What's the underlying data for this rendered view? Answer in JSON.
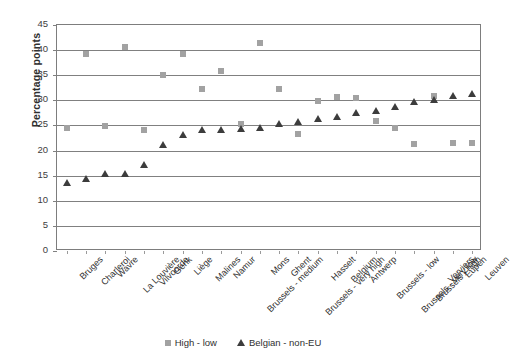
{
  "chart_data": {
    "type": "scatter",
    "title": "",
    "xlabel": "",
    "ylabel": "Percentage points",
    "ylim": [
      0,
      45
    ],
    "ytick_step": 5,
    "yticks": [
      0,
      5,
      10,
      15,
      20,
      25,
      30,
      35,
      40,
      45
    ],
    "grid": "horizontal",
    "legend_position": "bottom",
    "categories": [
      "Bruges",
      "Charleroi",
      "Wavre",
      "La Louvière",
      "Vilvoorde",
      "Genk",
      "Liège",
      "Malines",
      "Namur",
      "Brussels - medium",
      "Mons",
      "Ghent",
      "Brussels - very high",
      "Hasselt",
      "Belgium",
      "Antwerp",
      "Brussels - low",
      "Brussels - very low",
      "Brussels - high",
      "Verviers",
      "Eupen",
      "Leuven"
    ],
    "series": [
      {
        "name": "High - low",
        "marker": "square",
        "color": "#a2a2a2",
        "values": [
          24.4,
          39.2,
          24.8,
          40.6,
          24.0,
          35.1,
          39.3,
          32.2,
          35.9,
          25.2,
          41.4,
          32.2,
          23.3,
          29.8,
          30.6,
          30.4,
          25.8,
          24.4,
          21.4,
          30.8,
          21.5,
          21.5
        ]
      },
      {
        "name": "Belgian - non-EU",
        "marker": "triangle",
        "color": "#3c3c3c",
        "values": [
          13.6,
          14.4,
          15.3,
          15.4,
          17.2,
          21.2,
          23.0,
          24.0,
          24.0,
          24.3,
          24.5,
          25.2,
          25.6,
          26.2,
          26.7,
          27.4,
          27.8,
          28.6,
          29.6,
          30.0,
          30.8,
          31.3
        ]
      }
    ]
  },
  "legend": {
    "items": [
      {
        "label": "High - low",
        "marker": "square-marker"
      },
      {
        "label": "Belgian - non-EU",
        "marker": "triangle-marker"
      }
    ]
  },
  "axis": {
    "y_title": "Percentage points"
  }
}
